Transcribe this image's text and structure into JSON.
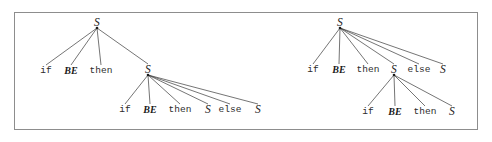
{
  "figure": {
    "caption": "",
    "border_color": "#8d8d8d",
    "background": "#ffffff",
    "ink_color": "#1a1a1a"
  },
  "symbols": {
    "start": "S",
    "boolean_expr": "BE",
    "kw_if": "if",
    "kw_then": "then",
    "kw_else": "else"
  },
  "trees": [
    {
      "id": "left-tree",
      "name": "parse-tree-else-binds-inner",
      "root": {
        "label": "S",
        "x": 97,
        "y": 23,
        "children": [
          {
            "label": "if",
            "kind": "terminal",
            "x": 46,
            "y": 71
          },
          {
            "label": "BE",
            "kind": "nonterminal",
            "x": 71,
            "y": 71
          },
          {
            "label": "then",
            "kind": "terminal",
            "x": 101,
            "y": 71
          },
          {
            "label": "S",
            "kind": "nonterminal",
            "x": 148,
            "y": 70,
            "children": [
              {
                "label": "if",
                "kind": "terminal",
                "x": 125,
                "y": 110
              },
              {
                "label": "BE",
                "kind": "nonterminal",
                "x": 150,
                "y": 110
              },
              {
                "label": "then",
                "kind": "terminal",
                "x": 180,
                "y": 110
              },
              {
                "label": "S",
                "kind": "nonterminal",
                "x": 208,
                "y": 110
              },
              {
                "label": "else",
                "kind": "terminal",
                "x": 230,
                "y": 110
              },
              {
                "label": "S",
                "kind": "nonterminal",
                "x": 258,
                "y": 110
              }
            ]
          }
        ]
      }
    },
    {
      "id": "right-tree",
      "name": "parse-tree-else-binds-outer",
      "root": {
        "label": "S",
        "x": 340,
        "y": 23,
        "children": [
          {
            "label": "if",
            "kind": "terminal",
            "x": 313,
            "y": 70
          },
          {
            "label": "BE",
            "kind": "nonterminal",
            "x": 339,
            "y": 70
          },
          {
            "label": "then",
            "kind": "terminal",
            "x": 368,
            "y": 70
          },
          {
            "label": "else",
            "kind": "terminal",
            "x": 419,
            "y": 70
          },
          {
            "label": "S",
            "kind": "nonterminal",
            "x": 443,
            "y": 70
          },
          {
            "label": "S",
            "kind": "nonterminal",
            "x": 394,
            "y": 70,
            "children": [
              {
                "label": "if",
                "kind": "terminal",
                "x": 368,
                "y": 112
              },
              {
                "label": "BE",
                "kind": "nonterminal",
                "x": 395,
                "y": 112
              },
              {
                "label": "then",
                "kind": "terminal",
                "x": 425,
                "y": 112
              },
              {
                "label": "S",
                "kind": "nonterminal",
                "x": 452,
                "y": 112
              }
            ]
          }
        ]
      }
    }
  ]
}
